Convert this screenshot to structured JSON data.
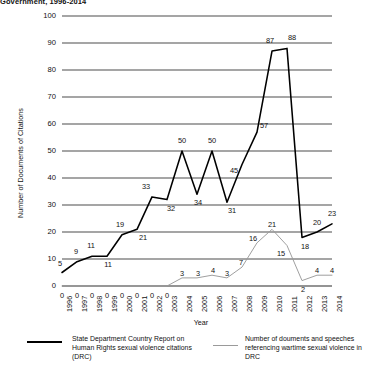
{
  "title": "Government, 1996-2014",
  "axes": {
    "ylabel": "Number of Documents of Citations",
    "xlabel": "Year",
    "yticks": [
      "0",
      "10",
      "20",
      "30",
      "40",
      "50",
      "60",
      "70",
      "80",
      "90",
      "100"
    ],
    "xticks": [
      "1996",
      "1997",
      "1998",
      "1999",
      "2000",
      "2001",
      "2002",
      "2003",
      "2004",
      "2005",
      "2006",
      "2007",
      "2008",
      "2009",
      "2010",
      "2011",
      "2012",
      "2013",
      "2014"
    ]
  },
  "legend": {
    "entries": [
      {
        "name": "state-dept-citations",
        "label": "State Department Country Report on Human Rights sexual violence citations (DRC)",
        "color": "#000000"
      },
      {
        "name": "wartime-sexual-violence-docs",
        "label": "Number of douments and speeches referencing wartime sexual violence in DRC",
        "color": "#9a9a9a"
      }
    ]
  },
  "chart_data": {
    "type": "line",
    "title": "Government, 1996-2014",
    "xlabel": "Year",
    "ylabel": "Number of Documents of Citations",
    "ylim": [
      0,
      100
    ],
    "ytick_step": 10,
    "grid": "horizontal",
    "legend_position": "bottom",
    "categories": [
      "1996",
      "1997",
      "1998",
      "1999",
      "2000",
      "2001",
      "2002",
      "2003",
      "2004",
      "2005",
      "2006",
      "2007",
      "2008",
      "2009",
      "2010",
      "2011",
      "2012",
      "2013",
      "2014"
    ],
    "series": [
      {
        "name": "State Department Country Report on Human Rights sexual violence citations (DRC)",
        "color": "#000000",
        "values": [
          5,
          9,
          11,
          11,
          19,
          21,
          33,
          32,
          50,
          34,
          50,
          31,
          45,
          57,
          87,
          88,
          18,
          20,
          23
        ]
      },
      {
        "name": "Number of douments and speeches referencing wartime sexual violence in DRC",
        "color": "#9a9a9a",
        "values": [
          0,
          0,
          0,
          0,
          0,
          0,
          0,
          0,
          3,
          3,
          4,
          3,
          7,
          16,
          21,
          15,
          2,
          4,
          4
        ]
      }
    ]
  }
}
